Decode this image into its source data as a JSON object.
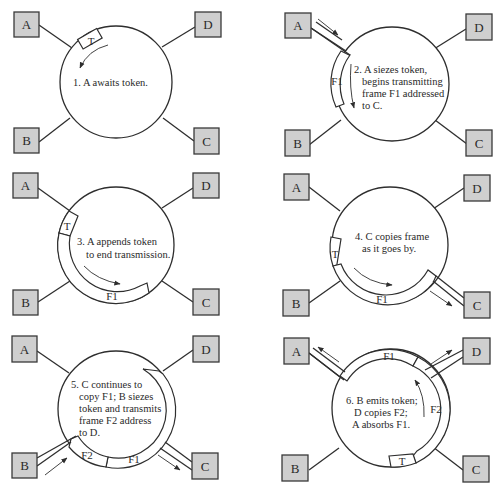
{
  "node_labels": {
    "A": "A",
    "B": "B",
    "C": "C",
    "D": "D"
  },
  "panels": [
    {
      "step": 1,
      "caption_lines": [
        "1. A awaits token."
      ],
      "segments": [
        {
          "label": "T"
        }
      ]
    },
    {
      "step": 2,
      "caption_lines": [
        "2. A siezes token,",
        "begins transmitting",
        "frame F1 addressed",
        "to C."
      ],
      "segments": [
        {
          "label": "F1"
        }
      ]
    },
    {
      "step": 3,
      "caption_lines": [
        "3. A appends token",
        "to end transmission."
      ],
      "segments": [
        {
          "label": "T"
        },
        {
          "label": "F1"
        }
      ]
    },
    {
      "step": 4,
      "caption_lines": [
        "4. C copies frame",
        "as it goes by."
      ],
      "segments": [
        {
          "label": "T"
        },
        {
          "label": "F1"
        }
      ]
    },
    {
      "step": 5,
      "caption_lines": [
        "5. C continues to",
        "copy F1; B siezes",
        "token and transmits",
        "frame F2 address",
        "to D."
      ],
      "segments": [
        {
          "label": "F2"
        },
        {
          "label": "F1"
        }
      ]
    },
    {
      "step": 6,
      "caption_lines": [
        "6. B emits token;",
        "D copies F2;",
        "A absorbs F1."
      ],
      "segments": [
        {
          "label": "F1"
        },
        {
          "label": "F2"
        },
        {
          "label": "T"
        }
      ]
    }
  ],
  "colors": {
    "node_fill": "#cfcfcf",
    "stroke": "#2e2e2e",
    "background": "#ffffff"
  }
}
